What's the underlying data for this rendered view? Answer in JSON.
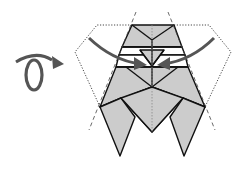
{
  "diagram": {
    "type": "origami-fold-instruction",
    "colors": {
      "paper_fill": "#cccccc",
      "crease_line": "#111111",
      "arrow": "#555555",
      "dotted_outline": "#333333",
      "background": "#ffffff"
    },
    "symbols": [
      {
        "name": "turn-over-icon",
        "meaning": "Turn model over"
      },
      {
        "name": "fold-arrow-left",
        "meaning": "Fold left side to center"
      },
      {
        "name": "fold-arrow-right",
        "meaning": "Fold right side to center"
      },
      {
        "name": "valley-fold-line-left",
        "meaning": "Dashed fold line (left)"
      },
      {
        "name": "valley-fold-line-right",
        "meaning": "Dashed fold line (right)"
      },
      {
        "name": "result-outline",
        "meaning": "Dotted outline of result position"
      }
    ]
  }
}
